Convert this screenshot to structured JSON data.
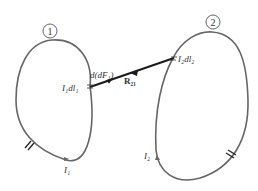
{
  "diagram": {
    "loop1": {
      "id_label": "1",
      "element_label": "I₁dl₁",
      "current_label": "I₁",
      "force_label": "d(dF₁)"
    },
    "loop2": {
      "id_label": "2",
      "element_label": "I₂dl₂",
      "current_label": "I₂"
    },
    "vector_label": "R₂₁",
    "colors": {
      "loop": "#666666",
      "vector": "#1a1a1a",
      "text": "#333333"
    }
  }
}
